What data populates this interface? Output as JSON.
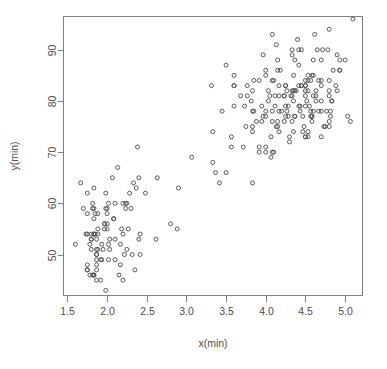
{
  "figure": {
    "background_color": "#ffffff",
    "frame_color": "#808080",
    "point_color": "#4a4a4a",
    "width": 387,
    "height": 369
  },
  "chart_data": {
    "type": "scatter",
    "title": "",
    "xlabel": "x(min)",
    "ylabel": "y(min)",
    "xlim": [
      1.45,
      5.22
    ],
    "ylim": [
      42.0,
      96.5
    ],
    "xticks": [
      1.5,
      2.0,
      2.5,
      3.0,
      3.5,
      4.0,
      4.5,
      5.0
    ],
    "xtick_labels": [
      "1.5",
      "2.0",
      "2.5",
      "3.0",
      "3.5",
      "4.0",
      "4.5",
      "5.0"
    ],
    "yticks": [
      50,
      60,
      70,
      80,
      90
    ],
    "ytick_labels": [
      "50",
      "60",
      "70",
      "80",
      "90"
    ],
    "grid": false,
    "legend": false,
    "marker": "open-circle",
    "marker_size": 4,
    "n_points": 272,
    "series": [
      {
        "name": "eruptions",
        "x": [
          3.6,
          1.8,
          3.333,
          2.283,
          4.533,
          2.883,
          4.7,
          3.6,
          1.95,
          4.35,
          1.833,
          3.917,
          4.2,
          1.75,
          4.7,
          2.167,
          1.75,
          4.8,
          1.6,
          4.25,
          1.8,
          1.75,
          3.45,
          3.067,
          4.533,
          3.6,
          1.967,
          4.083,
          3.85,
          4.433,
          4.3,
          4.467,
          3.367,
          4.033,
          3.833,
          2.017,
          1.867,
          4.833,
          1.833,
          4.783,
          4.35,
          1.883,
          4.567,
          1.75,
          4.533,
          3.317,
          3.833,
          2.1,
          4.633,
          2.0,
          4.8,
          4.716,
          1.833,
          4.833,
          1.733,
          4.883,
          3.717,
          1.667,
          4.567,
          4.317,
          2.233,
          4.5,
          1.75,
          4.8,
          1.817,
          4.4,
          4.167,
          4.7,
          2.067,
          4.7,
          4.033,
          1.967,
          4.5,
          4.0,
          1.983,
          5.067,
          2.017,
          4.567,
          3.883,
          3.6,
          4.133,
          4.333,
          4.1,
          2.633,
          4.067,
          4.933,
          3.95,
          4.517,
          2.167,
          4.0,
          2.2,
          4.333,
          1.867,
          4.817,
          1.833,
          4.3,
          4.667,
          3.75,
          1.867,
          4.9,
          2.483,
          4.367,
          2.1,
          4.5,
          4.05,
          1.867,
          4.7,
          1.783,
          4.85,
          3.683,
          4.733,
          2.3,
          4.9,
          4.417,
          1.7,
          4.633,
          2.317,
          4.6,
          1.817,
          4.417,
          2.617,
          4.067,
          4.25,
          1.967,
          4.6,
          3.767,
          1.917,
          4.5,
          2.267,
          4.65,
          1.867,
          4.167,
          2.8,
          4.333,
          1.833,
          4.383,
          1.883,
          4.933,
          2.033,
          3.733,
          4.233,
          2.233,
          4.533,
          4.817,
          4.333,
          1.983,
          4.633,
          2.017,
          5.1,
          1.8,
          5.033,
          4.0,
          2.4,
          4.6,
          3.567,
          4.0,
          4.5,
          4.083,
          1.8,
          3.967,
          2.2,
          4.15,
          2.0,
          3.833,
          3.5,
          4.583,
          2.367,
          5.0,
          1.933,
          4.617,
          1.917,
          2.083,
          4.583,
          3.333,
          4.167,
          4.333,
          4.5,
          2.417,
          4.0,
          4.167,
          1.883,
          4.583,
          4.25,
          3.767,
          2.033,
          4.433,
          4.083,
          1.833,
          4.417,
          2.183,
          4.8,
          1.833,
          4.8,
          4.1,
          3.966,
          4.233,
          3.5,
          4.366,
          2.25,
          4.667,
          2.1,
          4.35,
          4.133,
          1.867,
          4.6,
          1.783,
          4.367,
          3.85,
          1.933,
          4.5,
          2.383,
          4.7,
          1.867,
          3.833,
          3.417,
          4.233,
          2.4,
          4.8,
          2.0,
          4.15,
          1.867,
          4.267,
          1.75,
          4.483,
          4.0,
          4.117,
          4.083,
          4.267,
          3.917,
          4.55,
          4.083,
          2.417,
          4.183,
          2.217,
          4.45,
          1.883,
          1.85,
          4.283,
          3.95,
          2.333,
          4.15,
          2.35,
          4.933,
          2.9,
          4.583,
          3.833,
          2.083,
          4.367,
          2.133,
          4.35,
          2.2,
          4.45,
          3.567,
          4.5,
          4.15,
          3.817,
          3.917,
          4.45,
          2.0,
          4.283,
          4.767,
          4.533,
          1.85,
          4.25,
          1.983,
          2.25,
          4.75,
          4.117,
          2.15,
          4.417,
          1.817,
          4.467
        ],
        "y": [
          79,
          54,
          74,
          62,
          85,
          55,
          88,
          85,
          51,
          85,
          54,
          84,
          78,
          47,
          83,
          52,
          62,
          84,
          52,
          79,
          51,
          47,
          78,
          69,
          74,
          83,
          55,
          76,
          78,
          79,
          73,
          77,
          66,
          80,
          74,
          52,
          48,
          80,
          59,
          90,
          80,
          58,
          84,
          58,
          73,
          83,
          64,
          53,
          82,
          59,
          75,
          90,
          54,
          80,
          54,
          83,
          71,
          64,
          77,
          81,
          59,
          84,
          48,
          82,
          60,
          92,
          78,
          78,
          65,
          73,
          82,
          56,
          79,
          71,
          62,
          76,
          60,
          78,
          76,
          83,
          75,
          82,
          70,
          65,
          73,
          88,
          76,
          80,
          48,
          86,
          60,
          90,
          50,
          78,
          63,
          72,
          84,
          75,
          51,
          82,
          62,
          88,
          49,
          83,
          81,
          47,
          84,
          52,
          86,
          81,
          75,
          59,
          89,
          79,
          59,
          81,
          50,
          85,
          59,
          87,
          53,
          69,
          77,
          56,
          88,
          81,
          45,
          82,
          55,
          90,
          45,
          83,
          56,
          89,
          46,
          82,
          51,
          86,
          53,
          79,
          81,
          60,
          82,
          77,
          76,
          59,
          80,
          49,
          96,
          53,
          77,
          77,
          65,
          81,
          71,
          70,
          81,
          93,
          53,
          89,
          45,
          86,
          58,
          78,
          66,
          76,
          63,
          88,
          52,
          93,
          49,
          57,
          77,
          68,
          81,
          81,
          73,
          50,
          85,
          74,
          55,
          77,
          83,
          83,
          51,
          78,
          84,
          46,
          83,
          55,
          81,
          57,
          76,
          84,
          77,
          81,
          87,
          77,
          51,
          78,
          60,
          82,
          91,
          53,
          78,
          46,
          77,
          84,
          49,
          83,
          71,
          80,
          49,
          75,
          64,
          76,
          53,
          94,
          55,
          76,
          50,
          82,
          54,
          75,
          78,
          79,
          78,
          78,
          70,
          79,
          70,
          54,
          86,
          50,
          90,
          54,
          54,
          77,
          79,
          64,
          75,
          47,
          86,
          63,
          85,
          82,
          57,
          82,
          67,
          74,
          54,
          83,
          73,
          73,
          88,
          80,
          71,
          83,
          56,
          79,
          78,
          84,
          58,
          83,
          43,
          60,
          75,
          81,
          46,
          90,
          46,
          74
        ]
      }
    ]
  },
  "axes": {
    "x_title": "x(min)",
    "y_title": "y(min)",
    "x_tick_labels": [
      "1.5",
      "2.0",
      "2.5",
      "3.0",
      "3.5",
      "4.0",
      "4.5",
      "5.0"
    ],
    "y_tick_labels": [
      "50",
      "60",
      "70",
      "80",
      "90"
    ]
  }
}
